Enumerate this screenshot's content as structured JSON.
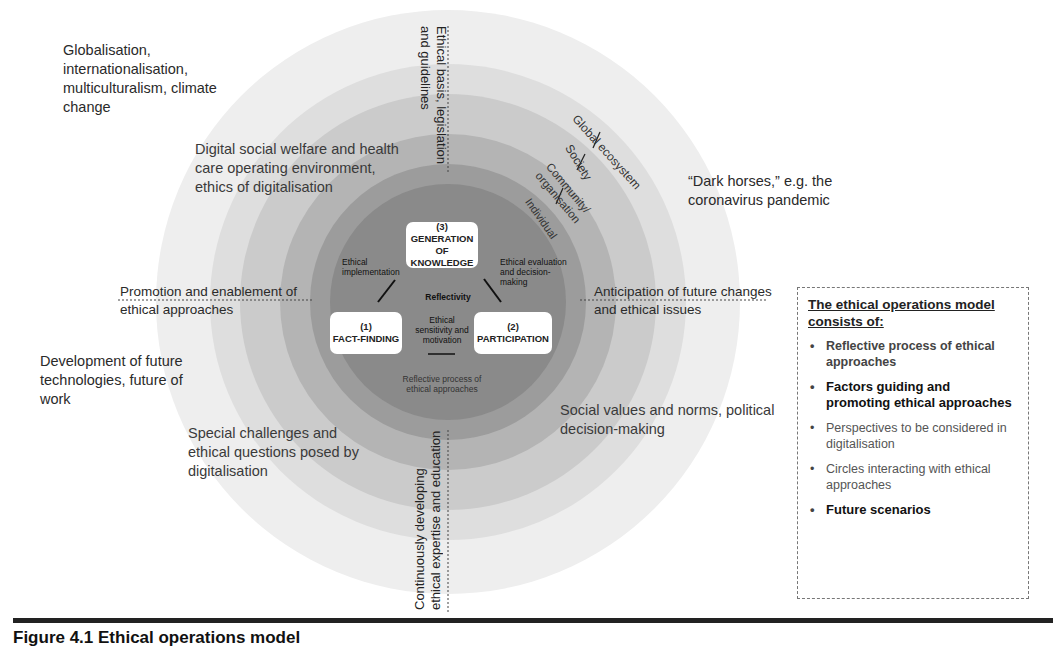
{
  "diagram": {
    "outer_labels": {
      "top_left": "Globalisation, internationalisation, multiculturalism, climate change",
      "top_right": "“Dark horses,” e.g. the coronavirus pandemic",
      "bottom_left": "Development of future technologies, future of work"
    },
    "ring_labels": {
      "upper_left": "Digital social welfare and health care operating environment, ethics of digitalisation",
      "lower_left": "Special challenges and ethical questions posed by digitalisation",
      "lower_right": "Social values and norms, political decision-making"
    },
    "axis_labels": {
      "top": "Ethical basis, legislation and guidelines",
      "bottom": "Continuously developing ethical expertise and education",
      "left": "Promotion and enablement of ethical approaches",
      "right": "Anticipation of future changes and ethical issues"
    },
    "level_labels": [
      "Global ecosystem",
      "Society",
      "Community/ organisation",
      "Individual"
    ],
    "core": {
      "box_top": "(3) GENERATION OF KNOWLEDGE",
      "box_left_num": "(1)",
      "box_left": "FACT-FINDING",
      "box_right_num": "(2)",
      "box_right": "PARTICIPATION",
      "link_left": "Ethical implementation",
      "link_right": "Ethical evaluation and decision-making",
      "center_top": "Reflectivity",
      "center_mid": "Ethical sensitivity and motivation",
      "center_bottom": "Reflective process of ethical approaches"
    },
    "ring_colors": [
      "#ececec",
      "#dcdcdc",
      "#c9c9c9",
      "#b3b3b3",
      "#9a9a9a",
      "#858585"
    ]
  },
  "legend": {
    "title": "The ethical operations model consists of:",
    "items": [
      "Reflective process of ethical approaches",
      "Factors guiding and promoting ethical approaches",
      "Perspectives to be considered in digitalisation",
      "Circles interacting with ethical approaches",
      "Future scenarios"
    ]
  },
  "caption": "Figure 4.1   Ethical operations model"
}
